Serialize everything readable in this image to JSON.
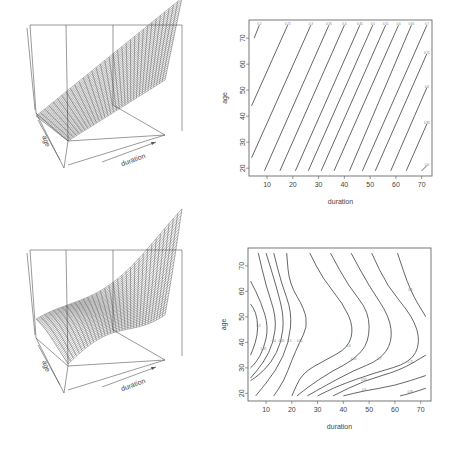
{
  "chart_data": [
    {
      "type": "surface",
      "panel": "top-left",
      "title": "",
      "xlabel": "duration",
      "ylabel": "age",
      "description": "3D wireframe perspective surface, nearly planar, rising from front-left to back-right along duration"
    },
    {
      "type": "contour",
      "panel": "top-right",
      "title": "",
      "xlabel": "duration",
      "ylabel": "age",
      "xticks": [
        10,
        20,
        30,
        40,
        50,
        60,
        70
      ],
      "yticks": [
        20,
        30,
        40,
        50,
        60,
        70
      ],
      "xlim": [
        3,
        74
      ],
      "ylim": [
        17,
        77
      ],
      "levels": [
        {
          "label": "0.2",
          "points": [
            [
              5,
              70
            ],
            [
              7,
              75
            ]
          ]
        },
        {
          "label": "0.25",
          "points": [
            [
              4,
              44
            ],
            [
              18,
              75
            ]
          ]
        },
        {
          "label": "0.3",
          "points": [
            [
              4,
              24
            ],
            [
              27,
              75
            ]
          ]
        },
        {
          "label": "0.35",
          "points": [
            [
              9,
              19
            ],
            [
              34,
              75
            ]
          ]
        },
        {
          "label": "0.4",
          "points": [
            [
              15,
              19
            ],
            [
              40,
              75
            ]
          ]
        },
        {
          "label": "0.45",
          "points": [
            [
              21,
              19
            ],
            [
              46,
              75
            ]
          ]
        },
        {
          "label": "0.5",
          "points": [
            [
              26,
              19
            ],
            [
              51,
              75
            ]
          ]
        },
        {
          "label": "0.55",
          "points": [
            [
              31,
              19
            ],
            [
              56,
              75
            ]
          ]
        },
        {
          "label": "0.6",
          "points": [
            [
              36,
              19
            ],
            [
              61,
              75
            ]
          ]
        },
        {
          "label": "0.65",
          "points": [
            [
              42,
              19
            ],
            [
              66,
              75
            ]
          ]
        },
        {
          "label": "0.7",
          "points": [
            [
              47,
              19
            ],
            [
              72,
              75
            ]
          ]
        },
        {
          "label": "0.75",
          "points": [
            [
              52,
              19
            ],
            [
              72,
              64
            ]
          ]
        },
        {
          "label": "0.8",
          "points": [
            [
              58,
              19
            ],
            [
              72,
              51
            ]
          ]
        },
        {
          "label": "0.85",
          "points": [
            [
              64,
              19
            ],
            [
              72,
              37
            ]
          ]
        },
        {
          "label": "0.9",
          "points": [
            [
              70,
              19
            ],
            [
              72,
              21
            ]
          ]
        }
      ]
    },
    {
      "type": "surface",
      "panel": "bottom-left",
      "title": "",
      "xlabel": "duration",
      "ylabel": "age",
      "description": "3D wireframe perspective surface with undulating wave shape"
    },
    {
      "type": "contour",
      "panel": "bottom-right",
      "title": "",
      "xlabel": "duration",
      "ylabel": "age",
      "xticks": [
        10,
        20,
        30,
        40,
        50,
        60,
        70
      ],
      "yticks": [
        20,
        30,
        40,
        50,
        60,
        70
      ],
      "xlim": [
        3,
        74
      ],
      "ylim": [
        17,
        77
      ],
      "levels": [
        {
          "label": "0.3",
          "points": [
            [
              4,
              55
            ],
            [
              6,
              52
            ],
            [
              7,
              46
            ],
            [
              6,
              40
            ],
            [
              4,
              35
            ]
          ]
        },
        {
          "label": "0.35",
          "points": [
            [
              4,
              64
            ],
            [
              8,
              56
            ],
            [
              11,
              46
            ],
            [
              9,
              37
            ],
            [
              6,
              32
            ],
            [
              4,
              30
            ]
          ]
        },
        {
          "label": "0.4",
          "points": [
            [
              7,
              75
            ],
            [
              10,
              62
            ],
            [
              14,
              50
            ],
            [
              13,
              40
            ],
            [
              9,
              32
            ],
            [
              4,
              26
            ]
          ]
        },
        {
          "label": "0.45",
          "points": [
            [
              10,
              75
            ],
            [
              14,
              62
            ],
            [
              17,
              50
            ],
            [
              16,
              40
            ],
            [
              12,
              32
            ],
            [
              7,
              27
            ],
            [
              4,
              25
            ]
          ]
        },
        {
          "label": "0.5",
          "points": [
            [
              13,
              75
            ],
            [
              16,
              63
            ],
            [
              20,
              52
            ],
            [
              19,
              40
            ],
            [
              14,
              29
            ],
            [
              6,
              19
            ]
          ]
        },
        {
          "label": "0.55",
          "points": [
            [
              18,
              75
            ],
            [
              19,
              63
            ],
            [
              25,
              53
            ],
            [
              26,
              46
            ],
            [
              23,
              40
            ],
            [
              20,
              33
            ],
            [
              17,
              25
            ],
            [
              13,
              19
            ]
          ]
        },
        {
          "label": "0.6",
          "points": [
            [
              27,
              75
            ],
            [
              32,
              65
            ],
            [
              40,
              55
            ],
            [
              44,
              46
            ],
            [
              42,
              38
            ],
            [
              33,
              33
            ],
            [
              24,
              28
            ],
            [
              20,
              19
            ]
          ]
        },
        {
          "label": "0.65",
          "points": [
            [
              35,
              75
            ],
            [
              42,
              62
            ],
            [
              50,
              52
            ],
            [
              50,
              40
            ],
            [
              44,
              33
            ],
            [
              36,
              29
            ],
            [
              27,
              23
            ],
            [
              22,
              19
            ]
          ]
        },
        {
          "label": "0.7",
          "points": [
            [
              43,
              75
            ],
            [
              50,
              62
            ],
            [
              58,
              50
            ],
            [
              59,
              40
            ],
            [
              54,
              33
            ],
            [
              44,
              29
            ],
            [
              33,
              23
            ],
            [
              26,
              19
            ]
          ]
        },
        {
          "label": "0.75",
          "points": [
            [
              51,
              75
            ],
            [
              57,
              62
            ],
            [
              67,
              50
            ],
            [
              70,
              40
            ],
            [
              66,
              32
            ],
            [
              52,
              28
            ],
            [
              38,
              23
            ],
            [
              30,
              19
            ]
          ]
        },
        {
          "label": "0.8",
          "points": [
            [
              61,
              75
            ],
            [
              66,
              60
            ],
            [
              72,
              50
            ]
          ]
        },
        {
          "label": "0.85",
          "points": [
            [
              72,
              35
            ],
            [
              62,
              29
            ],
            [
              48,
              25
            ],
            [
              36,
              19
            ]
          ]
        },
        {
          "label": "0.9",
          "points": [
            [
              72,
              27
            ],
            [
              60,
              23
            ],
            [
              48,
              21
            ],
            [
              40,
              19
            ]
          ]
        },
        {
          "label": "0.95",
          "points": [
            [
              72,
              22
            ],
            [
              66,
              20
            ],
            [
              62,
              19
            ]
          ]
        }
      ]
    }
  ]
}
